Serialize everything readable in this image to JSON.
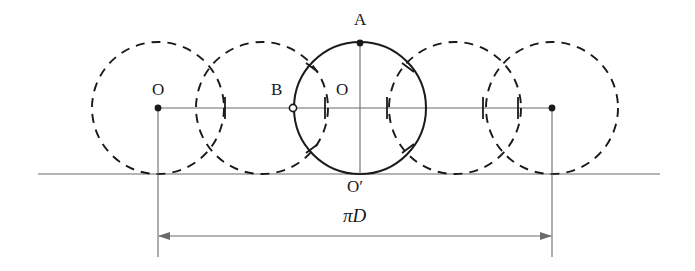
{
  "figure": {
    "colors": {
      "stroke": "#1a1a1a",
      "thin_line": "#6b6b6b",
      "background": "#ffffff",
      "dash": "#1a1a1a"
    },
    "geometry": {
      "circle_radius": 66,
      "center_y": 108,
      "ground_y": 174,
      "dimension_y": 236,
      "centers_x": [
        158,
        262,
        360,
        455,
        552
      ],
      "solid_circle_index": 2,
      "tick_marks_x": [
        225,
        325,
        387,
        483,
        518
      ],
      "endpoint_dots_x": [
        158,
        552
      ],
      "hollow_point_x": 293
    },
    "labels": [
      {
        "name": "label-O-left",
        "text": "O",
        "x": 152,
        "y": 81,
        "italic": false
      },
      {
        "name": "label-B",
        "text": "B",
        "x": 271,
        "y": 81,
        "italic": false
      },
      {
        "name": "label-O-center",
        "text": "O",
        "x": 336,
        "y": 81,
        "italic": false
      },
      {
        "name": "label-A",
        "text": "A",
        "x": 354,
        "y": 11,
        "italic": false
      },
      {
        "name": "label-O-prime",
        "text": "O′",
        "x": 347,
        "y": 178,
        "italic": false
      },
      {
        "name": "label-pi-D",
        "text": "πD",
        "x": 343,
        "y": 206,
        "italic": true
      }
    ],
    "dimension": {
      "label": "πD",
      "from_x": 158,
      "to_x": 552
    }
  }
}
